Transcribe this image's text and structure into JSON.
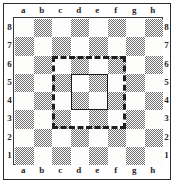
{
  "diagram": {
    "type": "chessboard-diagram",
    "board_size": 8,
    "files": [
      "a",
      "b",
      "c",
      "d",
      "e",
      "f",
      "g",
      "h"
    ],
    "ranks": [
      "8",
      "7",
      "6",
      "5",
      "4",
      "3",
      "2",
      "1"
    ],
    "colors": {
      "dark_square": "#6e6e6e",
      "light_square": "#fcfcfa",
      "border": "#2b2b2b",
      "overlay": "#1e1e1e",
      "label": "#262626"
    },
    "square_shading": [
      [
        "light",
        "dark",
        "light",
        "dark",
        "light",
        "dark",
        "light",
        "dark"
      ],
      [
        "dark",
        "light",
        "dark",
        "light",
        "dark",
        "light",
        "dark",
        "light"
      ],
      [
        "light",
        "dark",
        "light",
        "dark",
        "light",
        "dark",
        "light",
        "dark"
      ],
      [
        "dark",
        "light",
        "dark",
        "light",
        "dark",
        "light",
        "dark",
        "light"
      ],
      [
        "light",
        "dark",
        "light",
        "dark",
        "light",
        "dark",
        "light",
        "dark"
      ],
      [
        "dark",
        "light",
        "dark",
        "light",
        "dark",
        "light",
        "dark",
        "light"
      ],
      [
        "light",
        "dark",
        "light",
        "dark",
        "light",
        "dark",
        "light",
        "dark"
      ],
      [
        "dark",
        "light",
        "dark",
        "light",
        "dark",
        "light",
        "dark",
        "light"
      ]
    ],
    "regions": [
      {
        "name": "outer-highlight",
        "style": "dashed",
        "from_square": "c3",
        "to_square": "f6",
        "span": "4x4"
      },
      {
        "name": "inner-highlight",
        "style": "solid",
        "from_square": "d4",
        "to_square": "e5",
        "span": "2x2"
      }
    ]
  }
}
